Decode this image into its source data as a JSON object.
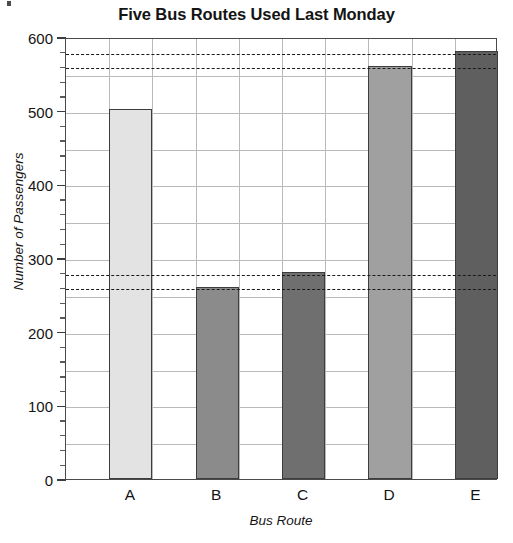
{
  "chart_data": {
    "type": "bar",
    "title": "Five Bus Routes Used Last Monday",
    "xlabel": "Bus Route",
    "ylabel": "Number of Passengers",
    "categories": [
      "A",
      "B",
      "C",
      "D",
      "E"
    ],
    "values": [
      502,
      260,
      281,
      561,
      581
    ],
    "series": [
      {
        "name": "Number of Passengers",
        "values": [
          502,
          260,
          281,
          561,
          581
        ]
      }
    ],
    "bar_colors": [
      "#e3e3e3",
      "#8b8b8b",
      "#6f6f6f",
      "#a0a0a0",
      "#5f5f5f"
    ],
    "bar_border_color": "#3d3d3d",
    "ylim": [
      0,
      600
    ],
    "ytick_labels": [
      "0",
      "100",
      "200",
      "300",
      "400",
      "500",
      "600"
    ],
    "ytick_values": [
      0,
      100,
      200,
      300,
      400,
      500,
      600
    ],
    "ytick_minor_step": 20,
    "gridline_step": 50,
    "grid": true,
    "grid_color": "#b9b9b9",
    "legend": "none",
    "reference_lines": [
      {
        "value": 580,
        "style": "dashed",
        "color": "#1a1a1a"
      },
      {
        "value": 560,
        "style": "dashed",
        "color": "#1a1a1a"
      },
      {
        "value": 280,
        "style": "dashed",
        "color": "#1a1a1a"
      },
      {
        "value": 260,
        "style": "dashed",
        "color": "#1a1a1a"
      }
    ]
  }
}
